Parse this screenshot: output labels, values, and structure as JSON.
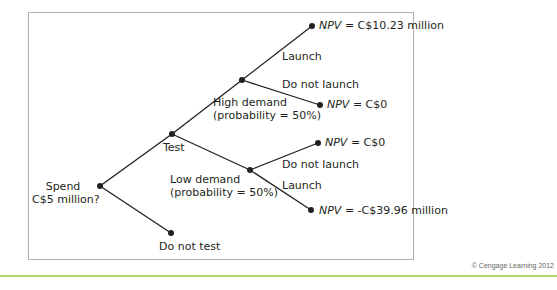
{
  "diagram": {
    "type": "decision-tree",
    "root": {
      "label": "Spend\nC$5 million?",
      "label_line1": "Spend",
      "label_line2": "C$5 million?"
    },
    "branches": {
      "test": "Test",
      "do_not_test": "Do not test",
      "high_demand_line1": "High demand",
      "high_demand_line2": "(probability = 50%)",
      "low_demand_line1": "Low demand",
      "low_demand_line2": "(probability = 50%)",
      "high_launch": "Launch",
      "high_do_not_launch": "Do not launch",
      "low_do_not_launch": "Do not launch",
      "low_launch": "Launch"
    },
    "outcomes": {
      "npv_label": "NPV",
      "high_launch_value": " = C$10.23 million",
      "high_do_not_launch_value": " = C$0",
      "low_do_not_launch_value": " = C$0",
      "low_launch_value": " = -C$39.96 million"
    },
    "colors": {
      "line": "#231f20",
      "frame": "#b8aea6",
      "rule": "#b5d36a"
    }
  },
  "footer": {
    "credit": "© Cengage Learning 2012"
  }
}
